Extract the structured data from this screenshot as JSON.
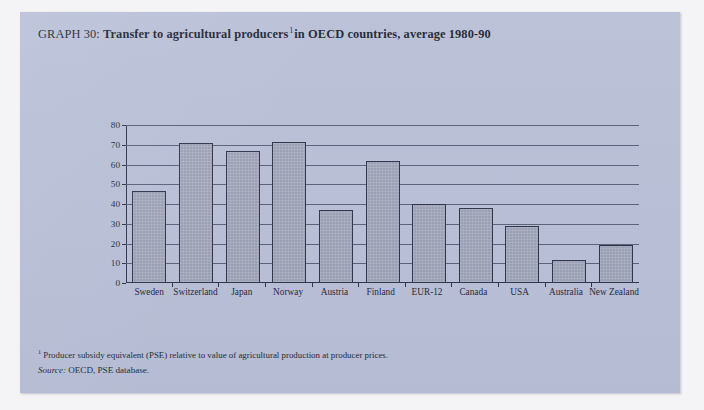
{
  "figure": {
    "label": "GRAPH 30:",
    "title_main": "Transfer to agricultural producers",
    "title_superscript": "1",
    "title_tail": "in OECD countries, average 1980-90"
  },
  "notes": {
    "footnote_marker": "1",
    "footnote_text": "Producer subsidy equivalent (PSE) relative to value of agricultural production at producer prices.",
    "source_label": "Source:",
    "source_text": "OECD, PSE database."
  },
  "colors": {
    "panel_background": "#b8bfd6",
    "bar_fill": "#9a9fb4",
    "bar_outline": "#2d3148",
    "gridline": "#575e78",
    "text": "#1b1f31"
  },
  "chart_data": {
    "type": "bar",
    "xlabel": "",
    "ylabel": "",
    "ylim": [
      0,
      80
    ],
    "yticks": [
      0,
      10,
      20,
      30,
      40,
      50,
      60,
      70,
      80
    ],
    "ytick_labels": [
      "0",
      "10",
      "20",
      "30",
      "40",
      "50",
      "60",
      "70",
      "80"
    ],
    "grid": true,
    "legend": false,
    "categories": [
      "Sweden",
      "Switzerland",
      "Japan",
      "Norway",
      "Austria",
      "Finland",
      "EUR-12",
      "Canada",
      "USA",
      "Australia",
      "New Zealand"
    ],
    "values": [
      46.5,
      71,
      67,
      71.5,
      37,
      62,
      40,
      38,
      29,
      11.5,
      19.5
    ]
  }
}
